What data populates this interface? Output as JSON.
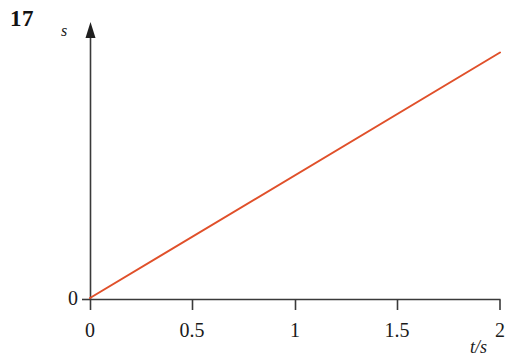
{
  "figure": {
    "number": "17",
    "background_color": "#ffffff",
    "axis_color": "#3a3a3a",
    "text_color": "#1a1a1a"
  },
  "chart_data": {
    "type": "line",
    "title": "",
    "subtitle": "",
    "figure_number": "17",
    "xlabel": "t/s",
    "ylabel": "s",
    "xlim": [
      0,
      2
    ],
    "ylim": [
      0,
      1
    ],
    "grid": false,
    "legend": null,
    "x_tick_labels": [
      "0",
      "0.5",
      "1",
      "1.5",
      "2"
    ],
    "x_ticks": [
      0,
      0.5,
      1,
      1.5,
      2
    ],
    "y_tick_labels": [
      "0"
    ],
    "y_ticks": [
      0
    ],
    "annotations": [],
    "series": [
      {
        "name": "s(t)",
        "color": "#e0502a",
        "line_width": 2,
        "x": [
          0,
          2
        ],
        "values": [
          0,
          0.93
        ]
      }
    ]
  },
  "axes": {
    "y_axis_arrow": true,
    "x_axis_arrow": false,
    "y_axis_label": "s",
    "x_axis_label": "t/s",
    "y_origin_label": "0"
  }
}
